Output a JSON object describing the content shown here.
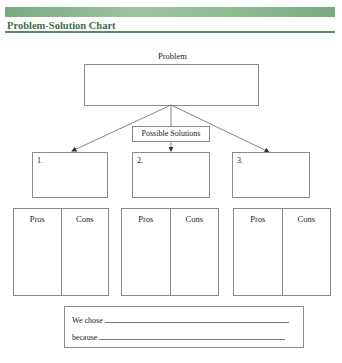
{
  "header": {
    "title": "Problem-Solution Chart",
    "accent_color": "#5b8a62"
  },
  "problem": {
    "label": "Problem"
  },
  "possible_solutions": {
    "label": "Possible Solutions"
  },
  "solutions": [
    {
      "number": "1."
    },
    {
      "number": "2."
    },
    {
      "number": "3."
    }
  ],
  "pros_cons": [
    {
      "pros": "Pros",
      "cons": "Cons"
    },
    {
      "pros": "Pros",
      "cons": "Cons"
    },
    {
      "pros": "Pros",
      "cons": "Cons"
    }
  ],
  "conclusion": {
    "chose_label": "We chose",
    "because_label": "because"
  }
}
